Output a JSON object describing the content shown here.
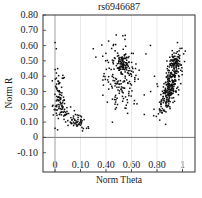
{
  "chart_data": {
    "type": "scatter",
    "title": "rs6946687",
    "xlabel": "Norm Theta",
    "ylabel": "Norm R",
    "x_tick_labels": [
      "0",
      "0.10",
      "0.40",
      "0.60",
      "0.80",
      "1"
    ],
    "y_tick_labels": [
      "0.80",
      "0.70",
      "0.60",
      "0.50",
      "0.40",
      "0.30",
      "0.20",
      "0.10",
      "0",
      "-0.10"
    ],
    "y_ticks": [
      0.8,
      0.7,
      0.6,
      0.5,
      0.4,
      0.3,
      0.2,
      0.1,
      0,
      -0.1
    ],
    "ylim": [
      -0.12,
      0.8
    ],
    "xlim": [
      -0.1,
      1.05
    ],
    "grid": "vertical lines at x ticks (faint)",
    "reference_lines": {
      "horizontal_y": 0,
      "vertical_x": 0
    },
    "point_color": "#111111",
    "clusters": [
      {
        "name": "AA cluster (near theta 0-0.1)",
        "x_center": 0.03,
        "y_center": 0.27,
        "spread_x": 0.025,
        "spread_y": 0.08,
        "n": 150,
        "trail": {
          "to_x": 0.22,
          "to_y": 0.08
        }
      },
      {
        "name": "AB cluster (theta ~0.5)",
        "x_center": 0.52,
        "y_center": 0.4,
        "spread_x": 0.06,
        "spread_y": 0.1,
        "n": 180
      },
      {
        "name": "BB cluster (theta ~0.9)",
        "x_center": 0.9,
        "y_center": 0.33,
        "spread_x": 0.05,
        "spread_y": 0.1,
        "n": 260
      }
    ],
    "sample_points": [
      [
        0.0,
        0.62
      ],
      [
        0.01,
        0.58
      ],
      [
        0.02,
        0.45
      ],
      [
        0.03,
        0.3
      ],
      [
        0.04,
        0.28
      ],
      [
        0.05,
        0.22
      ],
      [
        0.08,
        0.15
      ],
      [
        0.1,
        0.11
      ],
      [
        0.12,
        0.1
      ],
      [
        0.15,
        0.09
      ],
      [
        0.2,
        0.08
      ],
      [
        0.26,
        0.07
      ],
      [
        0.0,
        0.06
      ],
      [
        0.02,
        0.05
      ],
      [
        0.3,
        0.58
      ],
      [
        0.45,
        0.1
      ],
      [
        0.42,
        0.63
      ],
      [
        0.48,
        0.67
      ],
      [
        0.5,
        0.5
      ],
      [
        0.52,
        0.48
      ],
      [
        0.55,
        0.4
      ],
      [
        0.48,
        0.35
      ],
      [
        0.45,
        0.25
      ],
      [
        0.58,
        0.3
      ],
      [
        0.6,
        0.55
      ],
      [
        0.62,
        0.22
      ],
      [
        0.38,
        0.4
      ],
      [
        0.75,
        0.3
      ],
      [
        0.8,
        0.35
      ],
      [
        0.83,
        0.28
      ],
      [
        0.85,
        0.33
      ],
      [
        0.88,
        0.45
      ],
      [
        0.92,
        0.5
      ],
      [
        0.95,
        0.55
      ],
      [
        0.96,
        0.62
      ],
      [
        0.9,
        0.2
      ],
      [
        0.82,
        0.18
      ],
      [
        0.78,
        0.4
      ],
      [
        0.7,
        0.15
      ],
      [
        0.97,
        0.47
      ],
      [
        0.93,
        0.26
      ]
    ]
  },
  "colors": {
    "background": "#ffffff",
    "axis": "#333333",
    "grid": "#e3e3e3",
    "zero_line": "#555555",
    "points": "#111111"
  }
}
